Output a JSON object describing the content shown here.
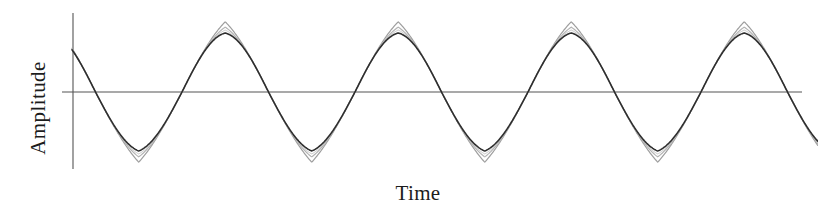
{
  "figure": {
    "background_color": "#ffffff",
    "axis_color": "#555555",
    "x_axis_label": "Time",
    "y_axis_label": "Amplitude"
  },
  "chart_data": {
    "type": "line",
    "title": "",
    "xlabel": "Time",
    "ylabel": "Amplitude",
    "grid": false,
    "legend": false,
    "x_ticks": [],
    "y_ticks": [],
    "xlim": [
      0,
      4.32
    ],
    "ylim": [
      -1.2,
      1.2
    ],
    "x_unit": "cycles",
    "period_cycles": 1,
    "cycles_shown": 4.32,
    "phase_offset_cycles": 0.12,
    "series": [
      {
        "name": "reference-wave",
        "color": "#2e2e2e",
        "line_width": 1.6,
        "amplitude": 1.0,
        "peak_amplitude": 1.0,
        "trough_amplitude": -1.0,
        "peak_sharpness": 0.18,
        "trough_sharpness": 0.3,
        "samples_x": [
          0,
          0.12,
          0.25,
          0.37,
          0.5,
          0.62,
          0.75,
          0.87,
          1.0,
          1.12,
          1.25,
          1.37,
          1.5,
          1.62,
          1.75,
          1.87,
          2.0,
          2.12,
          2.25,
          2.37,
          2.5,
          2.62,
          2.75,
          2.87,
          3.0,
          3.12,
          3.25,
          3.37,
          3.5,
          3.62,
          3.75,
          3.87,
          4.0,
          4.12,
          4.25,
          4.32
        ],
        "samples_y": [
          0.93,
          1.0,
          0.71,
          0.0,
          -0.71,
          -1.0,
          -0.71,
          0.0,
          0.71,
          1.0,
          0.71,
          0.0,
          -0.71,
          -1.0,
          -0.71,
          0.0,
          0.71,
          1.0,
          0.71,
          0.0,
          -0.71,
          -1.0,
          -0.71,
          0.0,
          0.71,
          1.0,
          0.71,
          0.0,
          -0.71,
          -1.0,
          -0.71,
          0.0,
          0.71,
          1.0,
          0.86,
          0.8
        ]
      },
      {
        "name": "overshoot-wave-1",
        "color": "#9e9e9e",
        "line_width": 1.2,
        "amplitude": 1.0,
        "peak_amplitude": 1.19,
        "trough_amplitude": -1.19,
        "peak_sharpness": 0.62,
        "trough_sharpness": 0.68
      },
      {
        "name": "overshoot-wave-2",
        "color": "#b4b4b4",
        "line_width": 1.2,
        "amplitude": 1.0,
        "peak_amplitude": 1.1,
        "trough_amplitude": -1.1,
        "peak_sharpness": 0.45,
        "trough_sharpness": 0.5
      },
      {
        "name": "overshoot-wave-3",
        "color": "#c4c4c4",
        "line_width": 1.0,
        "amplitude": 1.0,
        "peak_amplitude": 1.05,
        "trough_amplitude": -1.05,
        "peak_sharpness": 0.32,
        "trough_sharpness": 0.38
      }
    ],
    "axes": {
      "x_axis_line": {
        "y_value": 0,
        "x_from": -0.065,
        "x_to": 4.3
      },
      "y_axis_line": {
        "x_value": 0,
        "y_from": 1.32,
        "y_to": -1.3
      }
    }
  }
}
